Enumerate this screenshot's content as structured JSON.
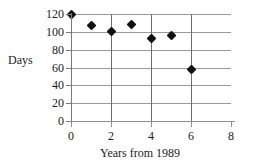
{
  "chart_data": {
    "type": "scatter",
    "title": "",
    "xlabel": "Years from 1989",
    "ylabel": "Days",
    "xlim": [
      0,
      8
    ],
    "ylim": [
      0,
      120
    ],
    "xticks": [
      0,
      2,
      4,
      6,
      8
    ],
    "yticks": [
      0,
      20,
      40,
      60,
      80,
      100,
      120
    ],
    "xtick_labels": [
      "0",
      "2",
      "4",
      "6",
      "8"
    ],
    "ytick_labels": [
      "0",
      "20",
      "40",
      "60",
      "80",
      "100",
      "120"
    ],
    "grid": true,
    "grid_axis": "both",
    "legend": false,
    "legend_position": "none",
    "marker": "diamond",
    "marker_color": "#111111",
    "gridline_color": "#9a9a9a",
    "axis_color": "#7a7a7a",
    "background_color": "#ffffff",
    "x": [
      0,
      1,
      2,
      3,
      4,
      5,
      6
    ],
    "values": [
      120,
      107,
      100,
      108,
      92,
      96,
      58
    ],
    "points": [
      {
        "x": 0,
        "y": 120
      },
      {
        "x": 1,
        "y": 107
      },
      {
        "x": 2,
        "y": 100
      },
      {
        "x": 3,
        "y": 108
      },
      {
        "x": 4,
        "y": 92
      },
      {
        "x": 5,
        "y": 96
      },
      {
        "x": 6,
        "y": 58
      }
    ]
  },
  "axes": {
    "y_title": "Days",
    "x_title": "Years from 1989",
    "y_tick_labels": [
      "120",
      "100",
      "80",
      "60",
      "40",
      "20",
      "0"
    ],
    "x_tick_labels": [
      "0",
      "2",
      "4",
      "6",
      "8"
    ]
  }
}
